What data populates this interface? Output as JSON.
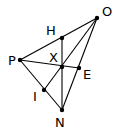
{
  "diagram": {
    "points": {
      "O": {
        "x": 97,
        "y": 18,
        "label": "O",
        "lx": 102,
        "ly": 16
      },
      "H": {
        "x": 62,
        "y": 38,
        "label": "H",
        "lx": 46,
        "ly": 35
      },
      "P": {
        "x": 20,
        "y": 60,
        "label": "P",
        "lx": 8,
        "ly": 65
      },
      "X": {
        "x": 62,
        "y": 67,
        "label": "X",
        "lx": 49,
        "ly": 62
      },
      "E": {
        "x": 79,
        "y": 68,
        "label": "E",
        "lx": 83,
        "ly": 79
      },
      "I": {
        "x": 44,
        "y": 90,
        "label": "I",
        "lx": 33,
        "ly": 101
      },
      "N": {
        "x": 62,
        "y": 110,
        "label": "N",
        "lx": 55,
        "ly": 127
      }
    },
    "segments": [
      [
        "P",
        "O"
      ],
      [
        "P",
        "N"
      ],
      [
        "O",
        "N"
      ],
      [
        "P",
        "E"
      ],
      [
        "H",
        "N"
      ],
      [
        "O",
        "I"
      ]
    ],
    "stroke_color": "#000000",
    "dot_radius": 2.2
  }
}
